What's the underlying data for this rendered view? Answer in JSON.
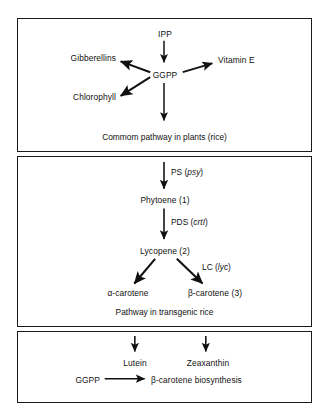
{
  "figure": {
    "type": "pathway-diagram",
    "panel_count": 3
  },
  "panels": {
    "common": {
      "caption": "Commom pathway in plants (rice)",
      "nodes": {
        "ipp": "IPP",
        "ggpp": "GGPP",
        "gibberellins": "Gibberellins",
        "chlorophyll": "Chlorophyll",
        "vitamin_e": "Vitamin E"
      }
    },
    "transgenic": {
      "caption": "Pathway in transgenic rice",
      "nodes": {
        "phytoene": "Phytoene (1)",
        "lycopene": "Lycopene (2)",
        "alpha_carotene": "α-carotene",
        "beta_carotene": "β-carotene (3)"
      },
      "enzymes": [
        {
          "abbrev": "PS",
          "gene": "psy",
          "label": "PS (psy)"
        },
        {
          "abbrev": "PDS",
          "gene": "crtI",
          "label": "PDS (crtI)"
        },
        {
          "abbrev": "LC",
          "gene": "lyc",
          "label": "LC (lyc)"
        }
      ]
    },
    "legend": {
      "nodes": {
        "lutein": "Lutein",
        "zeaxanthin": "Zeaxanthin",
        "ggpp": "GGPP",
        "biosynthesis": "β-carotene biosynthesis"
      }
    }
  },
  "colors": {
    "ink": "#111111",
    "border": "#1a1a1a",
    "background": "#ffffff"
  }
}
